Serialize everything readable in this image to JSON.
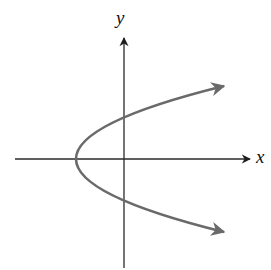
{
  "diagram": {
    "type": "graph-of-sideways-parabola",
    "axes": {
      "x_label": "x",
      "y_label": "y",
      "color": "#2a2a2a"
    },
    "curve": {
      "description": "Parabola opening to the right, vertex on negative x-axis, arrows on both ends",
      "color": "#6a6a6a",
      "vertex_px": [
        75,
        159
      ],
      "y_intercepts_px": [
        118,
        200
      ]
    }
  }
}
